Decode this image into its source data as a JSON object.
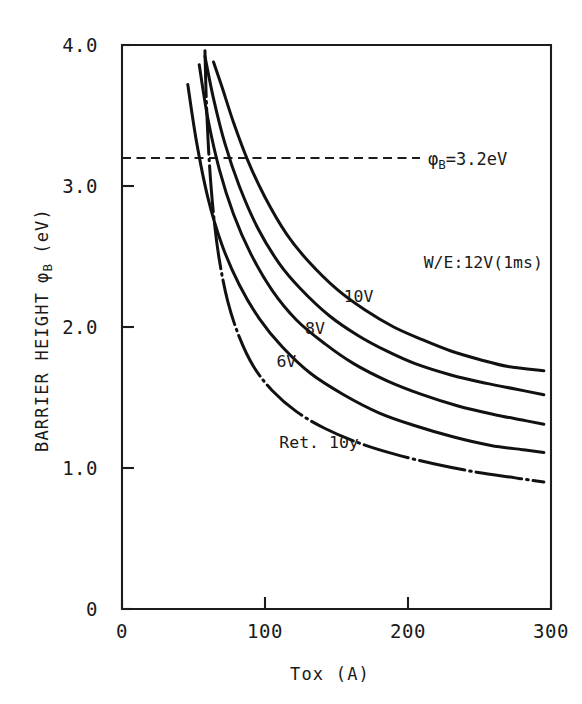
{
  "chart_data": {
    "type": "line",
    "title": "",
    "xlabel": "Tox (A)",
    "ylabel": "BARRIER HEIGHT φB  (eV)",
    "ylabel_main": "BARRIER HEIGHT",
    "ylabel_symbol": "φ",
    "ylabel_symbol_sub": "B",
    "ylabel_unit": "(eV)",
    "xlim": [
      0,
      300
    ],
    "ylim": [
      0,
      4.0
    ],
    "xticks": [
      0,
      100,
      200,
      300
    ],
    "xticklabels": [
      "0",
      "100",
      "200",
      "300"
    ],
    "yticks": [
      0,
      1.0,
      2.0,
      3.0,
      4.0
    ],
    "yticklabels": [
      "0",
      "1.0",
      "2.0",
      "3.0",
      "4.0"
    ],
    "grid": false,
    "legend_position": "inline-labels",
    "annotations": [
      {
        "name": "barrier-threshold",
        "text": "φB=3.2eV",
        "text_prefix": "φ",
        "text_sub": "B",
        "text_suffix": "=3.2eV",
        "type": "horizontal-dashed-line",
        "y_value": 3.2,
        "x_from": 0,
        "x_to": 300,
        "label_x": 208,
        "label_y": 3.25
      }
    ],
    "series": [
      {
        "name": "W/E:12V(1ms)",
        "label": "W/E:12V(1ms)",
        "style": "solid",
        "label_x": 211,
        "label_y": 2.42,
        "x": [
          64,
          70,
          78,
          88,
          100,
          115,
          130,
          150,
          170,
          190,
          210,
          230,
          250,
          270,
          295
        ],
        "y": [
          3.88,
          3.7,
          3.45,
          3.18,
          2.92,
          2.66,
          2.47,
          2.27,
          2.12,
          2.0,
          1.91,
          1.83,
          1.77,
          1.72,
          1.69
        ]
      },
      {
        "name": "10V",
        "label": "10V",
        "style": "solid",
        "label_x": 155,
        "label_y": 2.18,
        "x": [
          58,
          64,
          72,
          82,
          95,
          110,
          125,
          145,
          165,
          185,
          205,
          230,
          255,
          275,
          295
        ],
        "y": [
          3.92,
          3.62,
          3.3,
          3.0,
          2.7,
          2.45,
          2.27,
          2.08,
          1.94,
          1.83,
          1.74,
          1.66,
          1.6,
          1.56,
          1.52
        ]
      },
      {
        "name": "8V",
        "label": "8V",
        "style": "solid",
        "label_x": 128,
        "label_y": 1.95,
        "x": [
          54,
          60,
          68,
          78,
          90,
          105,
          122,
          142,
          162,
          185,
          210,
          235,
          260,
          280,
          295
        ],
        "y": [
          3.86,
          3.48,
          3.12,
          2.8,
          2.52,
          2.26,
          2.05,
          1.88,
          1.74,
          1.62,
          1.52,
          1.44,
          1.38,
          1.34,
          1.31
        ]
      },
      {
        "name": "6V",
        "label": "6V",
        "style": "solid",
        "label_x": 108,
        "label_y": 1.72,
        "x": [
          46,
          52,
          60,
          70,
          82,
          96,
          112,
          132,
          155,
          180,
          205,
          232,
          258,
          280,
          295
        ],
        "y": [
          3.72,
          3.32,
          2.92,
          2.58,
          2.3,
          2.06,
          1.86,
          1.67,
          1.52,
          1.39,
          1.3,
          1.22,
          1.16,
          1.13,
          1.11
        ]
      },
      {
        "name": "Ret. 10y",
        "label": "Ret. 10y",
        "style": "dash-dot",
        "label_x": 110,
        "label_y": 1.14,
        "x": [
          58,
          59,
          61,
          64,
          68,
          74,
          82,
          92,
          105,
          122,
          142,
          165,
          190,
          218,
          248,
          275,
          295
        ],
        "y": [
          3.96,
          3.6,
          3.18,
          2.8,
          2.48,
          2.18,
          1.93,
          1.72,
          1.55,
          1.4,
          1.28,
          1.18,
          1.1,
          1.03,
          0.97,
          0.93,
          0.9
        ]
      }
    ]
  },
  "axes": {
    "x_title": "Tox (A)",
    "y_title_text": "BARRIER HEIGHT",
    "y_title_symbol": "φ",
    "y_title_sub": "B",
    "y_title_unit": "(eV)"
  },
  "colors": {
    "ink": "#111111",
    "axis": "#1c1c1c",
    "background": "#ffffff"
  }
}
